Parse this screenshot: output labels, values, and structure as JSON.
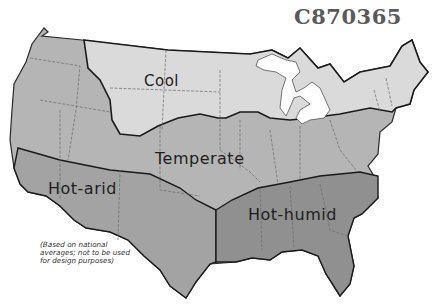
{
  "map": {
    "id_code": "C870365",
    "regions": [
      {
        "name": "Cool",
        "color": "#d9d9d9"
      },
      {
        "name": "Temperate",
        "color": "#b5b5b5"
      },
      {
        "name": "Hot-arid",
        "color": "#a2a2a2"
      },
      {
        "name": "Hot-humid",
        "color": "#8f8f8f"
      }
    ],
    "note": "(Based on national averages; not to be used for design purposes)"
  }
}
